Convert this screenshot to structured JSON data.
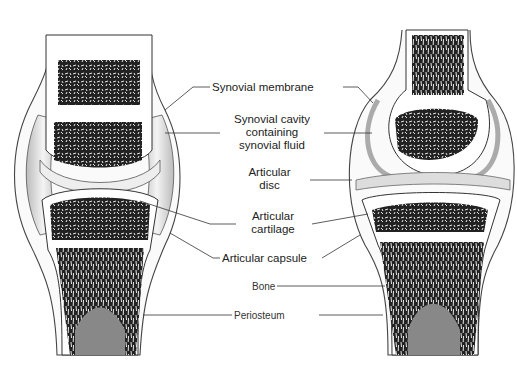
{
  "diagram": {
    "title": "",
    "panels": [
      {
        "id": "left",
        "description": "Synovial joint without articular disc"
      },
      {
        "id": "right",
        "description": "Synovial joint with articular disc"
      }
    ],
    "labels": {
      "synovial_membrane": "Synovial membrane",
      "synovial_cavity_line1": "Synovial cavity",
      "synovial_cavity_line2": "containing",
      "synovial_cavity_line3": "synovial fluid",
      "articular_disc_line1": "Articular",
      "articular_disc_line2": "disc",
      "articular_cartilage_line1": "Articular",
      "articular_cartilage_line2": "cartilage",
      "articular_capsule": "Articular capsule",
      "bone": "Bone",
      "periosteum": "Periosteum"
    },
    "colors": {
      "background": "#ffffff",
      "line": "#333333",
      "bone_texture": "#1a1a1a",
      "cartilage": "#f0f0f0",
      "shading": "#c8c8c8"
    }
  }
}
